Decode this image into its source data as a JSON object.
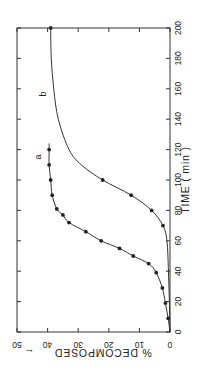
{
  "chart_data": {
    "type": "line",
    "orientation": "rotated-90-clockwise",
    "title": "",
    "xlabel": "TIME (min)",
    "ylabel": "% DECOMPOSED",
    "ylabel_arrow": "←",
    "xlim": [
      0,
      200
    ],
    "ylim": [
      0,
      50
    ],
    "xticks": [
      0,
      20,
      40,
      60,
      80,
      100,
      120,
      140,
      160,
      180,
      200
    ],
    "yticks": [
      0,
      10,
      20,
      30,
      40,
      50
    ],
    "grid": false,
    "legend": "inline labels",
    "series": [
      {
        "name": "a",
        "markers": true,
        "x": [
          0,
          9,
          19,
          29,
          39,
          45,
          50,
          55,
          60,
          66,
          72,
          77,
          81,
          90,
          100,
          110,
          120,
          124
        ],
        "y": [
          0,
          0.6,
          1.5,
          2.5,
          4.5,
          7,
          12,
          16.5,
          22.5,
          27.5,
          33,
          35,
          37,
          38.5,
          39,
          39.5,
          39.5,
          39.5
        ],
        "marker_indices": [
          1,
          2,
          3,
          4,
          5,
          6,
          7,
          8,
          9,
          10,
          11,
          12,
          13,
          14,
          15,
          16
        ]
      },
      {
        "name": "b",
        "markers": true,
        "x": [
          0,
          20,
          40,
          60,
          70,
          80,
          90,
          100,
          110,
          120,
          140,
          160,
          180,
          200
        ],
        "y": [
          0,
          0.2,
          0.5,
          1,
          2.3,
          6,
          12.7,
          22,
          29,
          33,
          36.5,
          38,
          38.8,
          39
        ],
        "marker_indices": [
          4,
          5,
          6,
          7,
          13
        ]
      }
    ]
  },
  "labels": {
    "curve_a": "a",
    "curve_b": "b",
    "x_axis_title": "TIME ( min )",
    "y_axis_title": "% DECOMPOSED",
    "y_axis_arrow": "←"
  }
}
